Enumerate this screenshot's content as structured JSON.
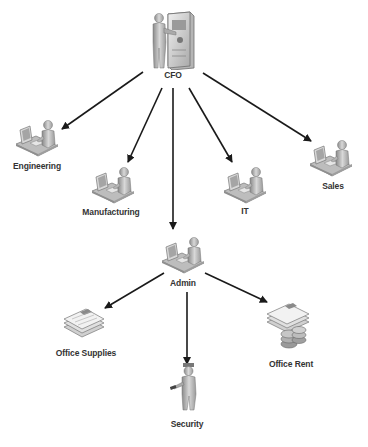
{
  "diagram": {
    "colors": {
      "background": "#ffffff",
      "arrow": "#1a1a1a",
      "icon_light": "#d9d9d9",
      "icon_mid": "#a8a8a8",
      "icon_dark": "#6e6e6e",
      "label": "#333333"
    },
    "nodes": [
      {
        "id": "cfo",
        "label": "CFO",
        "icon": "person-with-server-icon",
        "x": 173,
        "y": 38,
        "label_y": 76
      },
      {
        "id": "engineering",
        "label": "Engineering",
        "icon": "person-at-workstation-icon",
        "x": 35,
        "y": 140,
        "label_y": 165
      },
      {
        "id": "manufacturing",
        "label": "Manufacturing",
        "icon": "person-at-workstation-icon",
        "x": 110,
        "y": 180,
        "label_y": 211
      },
      {
        "id": "it",
        "label": "IT",
        "icon": "person-at-workstation-icon",
        "x": 243,
        "y": 180,
        "label_y": 210
      },
      {
        "id": "sales",
        "label": "Sales",
        "icon": "person-at-workstation-icon",
        "x": 330,
        "y": 155,
        "label_y": 185
      },
      {
        "id": "admin",
        "label": "Admin",
        "icon": "person-at-workstation-icon",
        "x": 181,
        "y": 255,
        "label_y": 282
      },
      {
        "id": "office_supplies",
        "label": "Office Supplies",
        "icon": "document-stack-icon",
        "x": 82,
        "y": 325,
        "label_y": 351
      },
      {
        "id": "security",
        "label": "Security",
        "icon": "security-guard-icon",
        "x": 187,
        "y": 398,
        "label_y": 423
      },
      {
        "id": "office_rent",
        "label": "Office Rent",
        "icon": "documents-with-coins-icon",
        "x": 290,
        "y": 330,
        "label_y": 362
      }
    ],
    "edges": [
      {
        "from": "cfo",
        "to": "engineering",
        "x1": 143,
        "y1": 72,
        "x2": 62,
        "y2": 129
      },
      {
        "from": "cfo",
        "to": "manufacturing",
        "x1": 162,
        "y1": 88,
        "x2": 128,
        "y2": 162
      },
      {
        "from": "cfo",
        "to": "admin",
        "x1": 173,
        "y1": 88,
        "x2": 173,
        "y2": 229
      },
      {
        "from": "cfo",
        "to": "it",
        "x1": 189,
        "y1": 88,
        "x2": 232,
        "y2": 162
      },
      {
        "from": "cfo",
        "to": "sales",
        "x1": 203,
        "y1": 73,
        "x2": 311,
        "y2": 141
      },
      {
        "from": "admin",
        "to": "office_supplies",
        "x1": 164,
        "y1": 273,
        "x2": 105,
        "y2": 308
      },
      {
        "from": "admin",
        "to": "security",
        "x1": 187,
        "y1": 292,
        "x2": 187,
        "y2": 364
      },
      {
        "from": "admin",
        "to": "office_rent",
        "x1": 205,
        "y1": 273,
        "x2": 267,
        "y2": 302
      }
    ]
  }
}
